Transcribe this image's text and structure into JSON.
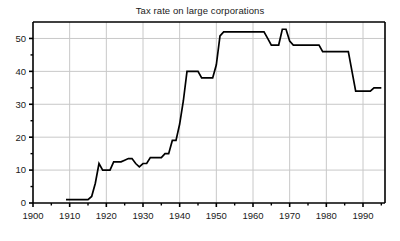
{
  "chart_data": {
    "type": "line",
    "title": "Tax rate on large corporations",
    "xlabel": "",
    "ylabel": "",
    "xlim": [
      1900,
      1996
    ],
    "ylim": [
      0,
      55
    ],
    "grid": true,
    "legend": null,
    "line_color": "#000000",
    "grid_color": "#c8c8c8",
    "axis_color": "#000000",
    "xticks": [
      1900,
      1910,
      1920,
      1930,
      1940,
      1950,
      1960,
      1970,
      1980,
      1990
    ],
    "xtick_labels": [
      "1900",
      "1910",
      "1920",
      "1930",
      "1940",
      "1950",
      "1960",
      "1970",
      "1980",
      "1990"
    ],
    "xminor_ticks": [
      1905,
      1915,
      1925,
      1935,
      1945,
      1955,
      1965,
      1975,
      1985,
      1995
    ],
    "yticks": [
      0,
      10,
      20,
      30,
      40,
      50
    ],
    "ytick_labels": [
      "0",
      "10",
      "20",
      "30",
      "40",
      "50"
    ],
    "yminor_ticks": [
      5,
      15,
      25,
      35,
      45
    ],
    "series": [
      {
        "name": "Tax rate on large corporations",
        "x": [
          1909,
          1910,
          1911,
          1912,
          1913,
          1914,
          1915,
          1916,
          1917,
          1918,
          1919,
          1920,
          1921,
          1922,
          1923,
          1924,
          1925,
          1926,
          1927,
          1928,
          1929,
          1930,
          1931,
          1932,
          1933,
          1934,
          1935,
          1936,
          1937,
          1938,
          1939,
          1940,
          1941,
          1942,
          1943,
          1944,
          1945,
          1946,
          1947,
          1948,
          1949,
          1950,
          1951,
          1952,
          1953,
          1954,
          1955,
          1956,
          1957,
          1958,
          1959,
          1960,
          1961,
          1962,
          1963,
          1964,
          1965,
          1966,
          1967,
          1968,
          1969,
          1970,
          1971,
          1972,
          1973,
          1974,
          1975,
          1976,
          1977,
          1978,
          1979,
          1980,
          1981,
          1982,
          1983,
          1984,
          1985,
          1986,
          1987,
          1988,
          1989,
          1990,
          1991,
          1992,
          1993,
          1994,
          1995
        ],
        "y": [
          1.0,
          1.0,
          1.0,
          1.0,
          1.0,
          1.0,
          1.0,
          2.0,
          6.0,
          12.0,
          10.0,
          10.0,
          10.0,
          12.5,
          12.5,
          12.5,
          13.0,
          13.5,
          13.5,
          12.0,
          11.0,
          12.0,
          12.0,
          13.8,
          13.8,
          13.8,
          13.8,
          15.0,
          15.0,
          19.0,
          19.0,
          24.0,
          31.0,
          40.0,
          40.0,
          40.0,
          40.0,
          38.0,
          38.0,
          38.0,
          38.0,
          42.0,
          50.75,
          52.0,
          52.0,
          52.0,
          52.0,
          52.0,
          52.0,
          52.0,
          52.0,
          52.0,
          52.0,
          52.0,
          52.0,
          50.0,
          48.0,
          48.0,
          48.0,
          52.8,
          52.8,
          49.2,
          48.0,
          48.0,
          48.0,
          48.0,
          48.0,
          48.0,
          48.0,
          48.0,
          46.0,
          46.0,
          46.0,
          46.0,
          46.0,
          46.0,
          46.0,
          46.0,
          40.0,
          34.0,
          34.0,
          34.0,
          34.0,
          34.0,
          35.0,
          35.0,
          35.0
        ]
      }
    ]
  }
}
